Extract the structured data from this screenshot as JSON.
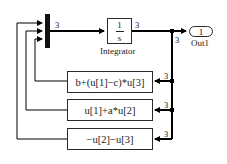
{
  "diagram": {
    "type": "simulink-block-diagram",
    "blocks": {
      "mux": {
        "inputs": 3
      },
      "integrator": {
        "numerator": "1",
        "denominator": "s",
        "label": "Integrator"
      },
      "outport": {
        "number": "1",
        "label": "Out1"
      },
      "fcn1": {
        "expr": "b+(u[1]−c)*u[3]"
      },
      "fcn2": {
        "expr": "u[1]+a*u[2]"
      },
      "fcn3": {
        "expr": "−u[2]−u[3]"
      }
    },
    "signal_widths": {
      "mux_out": "3",
      "integrator_out": "3",
      "branch_down": "3",
      "fcn1_in": "3",
      "fcn2_in": "3",
      "fcn3_in": "3"
    },
    "colors": {
      "line": "#000000",
      "block_border": "#2a2a2a",
      "background": "#ffffff"
    }
  }
}
